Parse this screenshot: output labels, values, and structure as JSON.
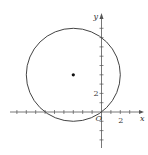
{
  "chart_data": {
    "type": "line",
    "title": "",
    "xlabel": "x",
    "ylabel": "y",
    "xlim": [
      -9,
      4
    ],
    "ylim": [
      -4,
      10
    ],
    "grid": false,
    "origin_label": "O",
    "x_tick_labels": [
      {
        "value": 2,
        "label": "2"
      }
    ],
    "y_tick_labels": [
      {
        "value": 2,
        "label": "2"
      }
    ],
    "x_ticks": [
      -9,
      -8,
      -7,
      -6,
      -5,
      -4,
      -3,
      -2,
      -1,
      1,
      2,
      3
    ],
    "y_ticks": [
      -3,
      -2,
      -1,
      1,
      2,
      3,
      4,
      5,
      6,
      7,
      8,
      9
    ],
    "circle": {
      "center": [
        -3,
        4
      ],
      "radius": 5
    },
    "points": [
      {
        "x": -3,
        "y": 4,
        "label": "center"
      }
    ],
    "colors": {
      "axis": "#555555",
      "curve": "#444444",
      "point": "#111111"
    }
  }
}
